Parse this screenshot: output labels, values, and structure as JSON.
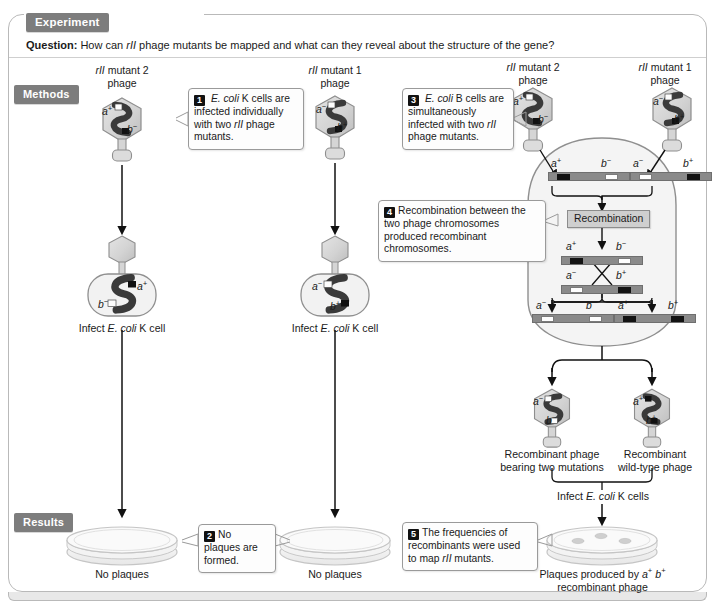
{
  "header": {
    "experiment_chip": "Experiment",
    "question_prefix": "Question:",
    "question_text": "How can rII phage mutants be mapped and what can they reveal about the structure of the gene?"
  },
  "sections": {
    "methods_chip": "Methods",
    "results_chip": "Results"
  },
  "left_panel": {
    "phage1_title_line1": "rII mutant 2",
    "phage1_title_line2": "phage",
    "phage1_allele_a": "a",
    "phage1_allele_a_sign": "+",
    "phage1_allele_b": "b",
    "phage1_allele_b_sign": "−",
    "phage2_title_line1": "rII mutant 1",
    "phage2_title_line2": "phage",
    "phage2_allele_a": "a",
    "phage2_allele_a_sign": "−",
    "phage2_allele_b": "b",
    "phage2_allele_b_sign": "+",
    "step1_num": "1",
    "step1_text": "E. coli K cells are infected individually with two rII phage mutants.",
    "cell1_label": "Infect E. coli K cell",
    "cell2_label": "Infect E. coli K cell",
    "cell1_allele_a": "a",
    "cell1_allele_a_sign": "+",
    "cell1_allele_b": "b",
    "cell1_allele_b_sign": "−",
    "cell2_allele_a": "a",
    "cell2_allele_a_sign": "−",
    "cell2_allele_b": "b",
    "cell2_allele_b_sign": "+",
    "step2_num": "2",
    "step2_text": "No plaques are formed.",
    "dish1_label": "No plaques",
    "dish2_label": "No plaques"
  },
  "right_panel": {
    "phage3_title_line1": "rII mutant 2",
    "phage3_title_line2": "phage",
    "phage4_title_line1": "rII mutant 1",
    "phage4_title_line2": "phage",
    "phage3_allele_a": "a",
    "phage3_allele_a_sign": "+",
    "phage3_allele_b": "b",
    "phage3_allele_b_sign": "−",
    "phage4_allele_a": "a",
    "phage4_allele_a_sign": "−",
    "phage4_allele_b": "b",
    "phage4_allele_b_sign": "+",
    "step3_num": "3",
    "step3_text": "E. coli B cells are simultaneously infected with two rII phage mutants.",
    "step4_num": "4",
    "step4_text": "Recombination between the two phage chromosomes produced recombinant chromosomes.",
    "recombination_box": "Recombination",
    "chromosomes": {
      "parental": [
        {
          "a": "a",
          "a_sign": "+",
          "b": "b",
          "b_sign": "−"
        },
        {
          "a": "a",
          "a_sign": "−",
          "b": "b",
          "b_sign": "+"
        }
      ],
      "crossing": [
        {
          "a": "a",
          "a_sign": "+",
          "b": "b",
          "b_sign": "−"
        },
        {
          "a": "a",
          "a_sign": "−",
          "b": "b",
          "b_sign": "+"
        }
      ],
      "recombinant": [
        {
          "a": "a",
          "a_sign": "−",
          "b": "b",
          "b_sign": "−"
        },
        {
          "a": "a",
          "a_sign": "+",
          "b": "b",
          "b_sign": "+"
        }
      ]
    },
    "recombinant_phage_left_line1": "Recombinant phage",
    "recombinant_phage_left_line2": "bearing two mutations",
    "recombinant_phage_right_line1": "Recombinant",
    "recombinant_phage_right_line2": "wild-type phage",
    "rec_phage_left_allele_a": "a",
    "rec_phage_left_allele_a_sign": "−",
    "rec_phage_left_allele_b": "b",
    "rec_phage_left_allele_b_sign": "−",
    "rec_phage_right_allele_a": "a",
    "rec_phage_right_allele_a_sign": "+",
    "rec_phage_right_allele_b": "b",
    "rec_phage_right_allele_b_sign": "+",
    "infect_k_cells_label": "Infect E. coli K cells",
    "step5_num": "5",
    "step5_text": "The frequencies of recombinants were used to map rII mutants.",
    "dish3_label_line1": "Plaques produced by a+ b+",
    "dish3_label_line2": "recombinant phage",
    "plaque_count": 3
  },
  "colors": {
    "chip_gray": "#7d7d7d",
    "frame_border": "#b9b9b9",
    "phage_fill": "#d9d9d9",
    "dna_dark": "#3a3a3a",
    "chromosome_gray": "#8a8a8a",
    "allele_plus": "#131313",
    "allele_minus": "#fdfdfd",
    "recomb_box_fill": "#cfcfcf",
    "bigcell_fill": "#f4f4f4"
  }
}
